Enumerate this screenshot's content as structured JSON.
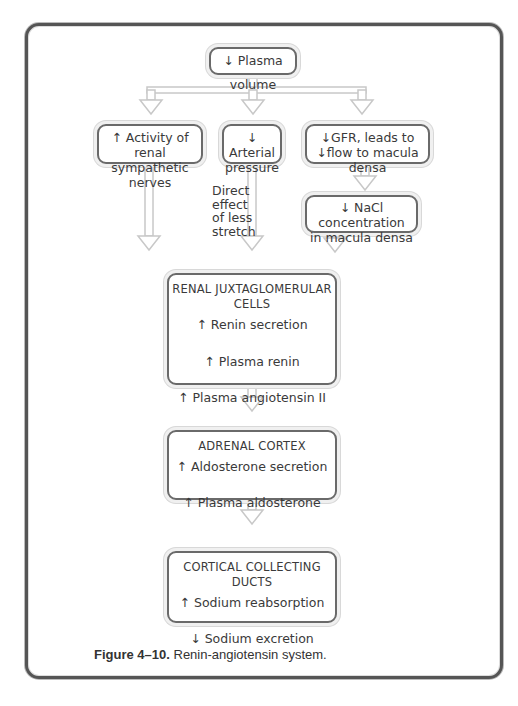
{
  "diagram": {
    "top": {
      "label": "↓ Plasma volume"
    },
    "branches": [
      {
        "line1": "↑ Activity of renal",
        "line2": "sympathetic nerves"
      },
      {
        "line1": "↓ Arterial",
        "line2": "pressure"
      },
      {
        "line1": "↓GFR, leads to",
        "line2": "↓flow to macula densa"
      }
    ],
    "macula": {
      "line1": "↓ NaCl concentration",
      "line2": "in macula densa"
    },
    "side_label": [
      "Direct",
      "effect",
      "of less",
      "stretch"
    ],
    "juxta": {
      "title": "RENAL JUXTAGLOMERULAR CELLS",
      "items": [
        "↑ Renin secretion",
        "↑ Plasma renin",
        "↑ Plasma angiotensin II"
      ]
    },
    "adrenal": {
      "title": "ADRENAL CORTEX",
      "items": [
        "↑ Aldosterone secretion",
        "↑ Plasma aldosterone"
      ]
    },
    "cortical": {
      "title": "CORTICAL COLLECTING DUCTS",
      "items": [
        "↑ Sodium reabsorption",
        "↓ Sodium excretion"
      ]
    }
  },
  "caption": {
    "figure_label": "Figure 4–10.",
    "text": " Renin-angiotensin system."
  }
}
